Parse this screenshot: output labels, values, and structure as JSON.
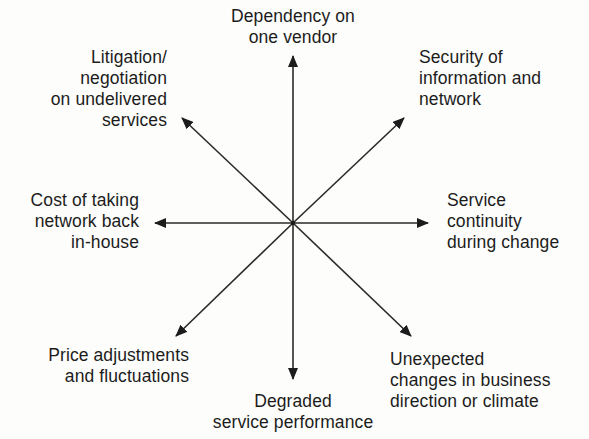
{
  "diagram": {
    "type": "radial-arrows",
    "center": {
      "x": 293,
      "y": 223
    },
    "stroke_color": "#2a2a2a",
    "labels": {
      "n": "Dependency on\none vendor",
      "ne": "Security of\ninformation and\nnetwork",
      "e": "Service\ncontinuity\nduring change",
      "se": "Unexpected\nchanges in business\ndirection or climate",
      "s": "Degraded\nservice performance",
      "sw": "Price adjustments\nand fluctuations",
      "w": "Cost of taking\nnetwork back\nin-house",
      "nw": "Litigation/\nnegotiation\non undelivered\nservices"
    },
    "arrows": [
      {
        "id": "n",
        "x2": 293,
        "y2": 56
      },
      {
        "id": "ne",
        "x2": 404,
        "y2": 118
      },
      {
        "id": "e",
        "x2": 428,
        "y2": 223
      },
      {
        "id": "se",
        "x2": 411,
        "y2": 336
      },
      {
        "id": "s",
        "x2": 293,
        "y2": 379
      },
      {
        "id": "sw",
        "x2": 176,
        "y2": 336
      },
      {
        "id": "w",
        "x2": 155,
        "y2": 223
      },
      {
        "id": "nw",
        "x2": 182,
        "y2": 118
      }
    ]
  }
}
